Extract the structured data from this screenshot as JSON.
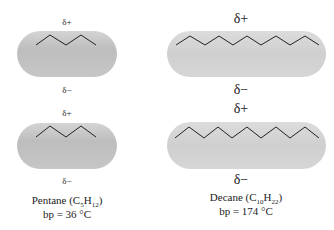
{
  "left": {
    "molecule": "Pentane",
    "formula_prefix": "Pentane (C",
    "c_count": "5",
    "h_symbol": "H",
    "h_count": "12",
    "formula_suffix": ")",
    "bp": "bp = 36 °C",
    "top_pair": {
      "plus": "δ+",
      "minus": "δ−"
    },
    "bottom_pair": {
      "plus": "δ+",
      "minus": "δ−"
    }
  },
  "right": {
    "molecule": "Decane",
    "formula_prefix": "Decane (C",
    "c_count": "10",
    "h_symbol": "H",
    "h_count": "22",
    "formula_suffix": ")",
    "bp": "bp = 174 °C",
    "top_pair": {
      "plus": "δ+",
      "minus": "δ−"
    },
    "bottom_pair": {
      "plus": "δ+",
      "minus": "δ−"
    }
  },
  "colors": {
    "pill": "#c4c4c4",
    "line": "#222222"
  }
}
